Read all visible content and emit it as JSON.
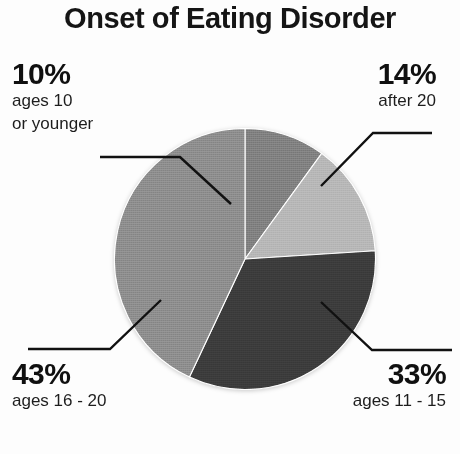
{
  "title": "Onset of Eating Disorder",
  "chart_data": {
    "type": "pie",
    "title": "Onset of Eating Disorder",
    "xlabel": "",
    "ylabel": "",
    "legend_position": "callouts",
    "grid": false,
    "units": "percent",
    "start_angle_deg": 0,
    "direction": "clockwise",
    "categories": [
      "ages 10 or younger",
      "after 20",
      "ages 11 - 15",
      "ages 16 - 20"
    ],
    "values": [
      10,
      14,
      33,
      43
    ],
    "colors": [
      "#7d7d7d",
      "#b5b5b5",
      "#3a3a3a",
      "#8a8a8a"
    ],
    "slices": [
      {
        "id": "slice-10",
        "percent": 10,
        "percent_label": "10%",
        "desc_line1": "ages 10",
        "desc_line2": "or younger",
        "color": "#7d7d7d",
        "start_deg": 0,
        "end_deg": 36
      },
      {
        "id": "slice-14",
        "percent": 14,
        "percent_label": "14%",
        "desc_line1": "after 20",
        "desc_line2": "",
        "color": "#b5b5b5",
        "start_deg": 36,
        "end_deg": 86.4
      },
      {
        "id": "slice-33",
        "percent": 33,
        "percent_label": "33%",
        "desc_line1": "ages 11 - 15",
        "desc_line2": "",
        "color": "#3a3a3a",
        "start_deg": 86.4,
        "end_deg": 205.2
      },
      {
        "id": "slice-43",
        "percent": 43,
        "percent_label": "43%",
        "desc_line1": "ages 16 - 20",
        "desc_line2": "",
        "color": "#8a8a8a",
        "start_deg": 205.2,
        "end_deg": 360
      }
    ]
  },
  "callouts": {
    "top_left": {
      "percent_label": "10%",
      "line1": "ages 10",
      "line2": "or younger"
    },
    "top_right": {
      "percent_label": "14%",
      "line1": "after 20",
      "line2": ""
    },
    "bottom_left": {
      "percent_label": "43%",
      "line1": "ages 16 - 20",
      "line2": ""
    },
    "bottom_right": {
      "percent_label": "33%",
      "line1": "ages 11 - 15",
      "line2": ""
    }
  },
  "colors": {
    "background": "#fdfdfd",
    "text": "#101010",
    "leader_line": "#111111"
  }
}
